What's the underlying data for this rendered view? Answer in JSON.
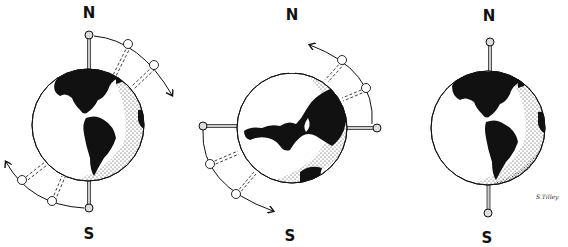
{
  "diagram": {
    "colors": {
      "ink": "#111111",
      "paper": "#ffffff",
      "land": "#111111"
    },
    "panels": [
      {
        "id": "left",
        "north_label": "N",
        "south_label": "S",
        "axis": "vertical-tilted",
        "rotation_arrows": "clockwise"
      },
      {
        "id": "middle",
        "north_label": "N",
        "south_label": "S",
        "axis": "horizontal",
        "rotation_arrows": "counter-clockwise"
      },
      {
        "id": "right",
        "north_label": "N",
        "south_label": "S",
        "axis": "vertical",
        "rotation_arrows": "none"
      }
    ],
    "signature": "S.Tilley"
  }
}
